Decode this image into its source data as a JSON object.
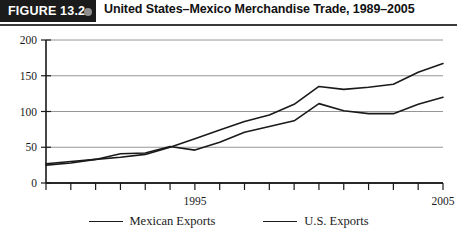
{
  "figure": {
    "tag": "FIGURE 13.2",
    "bullet_icon": "filled-circle-icon",
    "title": "United States–Mexico Merchandise Trade, 1989–2005"
  },
  "chart_data": {
    "type": "line",
    "title": "United States–Mexico Merchandise Trade, 1989–2005",
    "xlabel": "",
    "ylabel": "",
    "xlim": [
      1989,
      2005
    ],
    "ylim": [
      0,
      200
    ],
    "yticks": [
      0,
      50,
      100,
      150,
      200
    ],
    "ytick_labels": [
      "0",
      "50",
      "100",
      "150",
      "200"
    ],
    "xticks": [
      1989,
      1990,
      1991,
      1992,
      1993,
      1994,
      1995,
      1996,
      1997,
      1998,
      1999,
      2000,
      2001,
      2002,
      2003,
      2004,
      2005
    ],
    "xtick_labels_shown": [
      "1995",
      "2005"
    ],
    "xtick_label_values": [
      1995,
      2005
    ],
    "grid": "horizontal",
    "legend_position": "bottom",
    "x": [
      1989,
      1990,
      1991,
      1992,
      1993,
      1994,
      1995,
      1996,
      1997,
      1998,
      1999,
      2000,
      2001,
      2002,
      2003,
      2004,
      2005
    ],
    "series": [
      {
        "name": "Mexican Exports",
        "color": "#1a1a1a",
        "values": [
          27,
          30,
          33,
          36,
          40,
          50,
          62,
          74,
          86,
          95,
          110,
          135,
          131,
          134,
          138,
          155,
          167
        ]
      },
      {
        "name": "U.S. Exports",
        "color": "#1a1a1a",
        "values": [
          25,
          28,
          33,
          41,
          42,
          51,
          46,
          57,
          71,
          79,
          87,
          111,
          101,
          97,
          97,
          110,
          120
        ]
      }
    ]
  },
  "legend": {
    "entries": [
      {
        "label": "Mexican Exports"
      },
      {
        "label": "U.S. Exports"
      }
    ]
  }
}
